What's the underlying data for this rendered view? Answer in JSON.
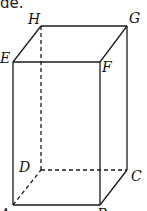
{
  "caption_fragment": "de.",
  "figure": {
    "type": "rectangular-prism",
    "vertices": {
      "A": {
        "x": 13,
        "y": 205,
        "label": "A"
      },
      "B": {
        "x": 100,
        "y": 205,
        "label": "B"
      },
      "C": {
        "x": 127,
        "y": 170,
        "label": "C"
      },
      "D": {
        "x": 41,
        "y": 170,
        "label": "D"
      },
      "E": {
        "x": 13,
        "y": 62,
        "label": "E"
      },
      "F": {
        "x": 100,
        "y": 62,
        "label": "F"
      },
      "G": {
        "x": 127,
        "y": 26,
        "label": "G"
      },
      "H": {
        "x": 41,
        "y": 26,
        "label": "H"
      }
    },
    "visible_edges": [
      "AB",
      "BC",
      "CG",
      "GH",
      "HE",
      "EA",
      "EF",
      "FG",
      "FB"
    ],
    "hidden_edges": [
      "AD",
      "DC",
      "DH"
    ],
    "labels": {
      "A": "A",
      "B": "B",
      "C": "C",
      "D": "D",
      "E": "E",
      "F": "F",
      "G": "G",
      "H": "H"
    }
  }
}
